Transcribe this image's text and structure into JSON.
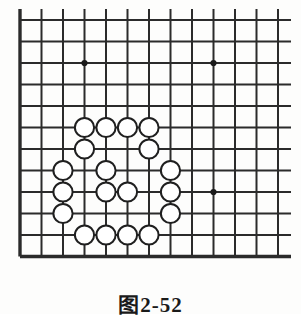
{
  "figure": {
    "caption_label": "图",
    "caption_number": "2-52",
    "caption_full": "图 2-52",
    "type": "go-board-diagram"
  },
  "board": {
    "columns": 13,
    "rows": 12,
    "origin_x": 20,
    "origin_y": 20,
    "spacing": 21.5,
    "line_color": "#2b2b2b",
    "thin_line_width": 2.0,
    "thick_line_width": 3.4,
    "background_color": "#fdfdfc",
    "edge_overhang_right": 13,
    "edge_overhang_top": 11
  },
  "star_points": {
    "label": "hoshi",
    "radius": 3.1,
    "color": "#1a1a1a",
    "points": [
      {
        "col": 3,
        "row": 2
      },
      {
        "col": 9,
        "row": 2
      },
      {
        "col": 9,
        "row": 8
      }
    ]
  },
  "stones": {
    "color_name": "white",
    "fill": "#ffffff",
    "stroke": "#1f1f1f",
    "stroke_width": 2.0,
    "radius": 9.6,
    "count": 19,
    "points": [
      {
        "col": 3,
        "row": 5
      },
      {
        "col": 4,
        "row": 5
      },
      {
        "col": 5,
        "row": 5
      },
      {
        "col": 6,
        "row": 5
      },
      {
        "col": 3,
        "row": 6
      },
      {
        "col": 6,
        "row": 6
      },
      {
        "col": 2,
        "row": 7
      },
      {
        "col": 4,
        "row": 7
      },
      {
        "col": 7,
        "row": 7
      },
      {
        "col": 2,
        "row": 8
      },
      {
        "col": 4,
        "row": 8
      },
      {
        "col": 5,
        "row": 8
      },
      {
        "col": 7,
        "row": 8
      },
      {
        "col": 2,
        "row": 9
      },
      {
        "col": 7,
        "row": 9
      },
      {
        "col": 3,
        "row": 10
      },
      {
        "col": 4,
        "row": 10
      },
      {
        "col": 5,
        "row": 10
      },
      {
        "col": 6,
        "row": 10
      }
    ]
  }
}
